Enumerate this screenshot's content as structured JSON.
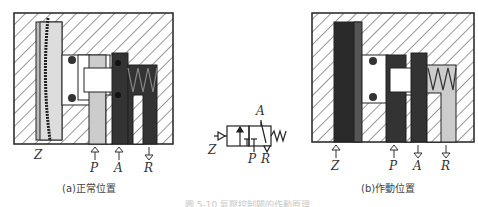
{
  "left_panel": {
    "caption": "(a)正常位置",
    "ports": [
      {
        "label": "Z",
        "arrow": "none"
      },
      {
        "label": "P",
        "arrow": "up"
      },
      {
        "label": "A",
        "arrow": "up"
      },
      {
        "label": "R",
        "arrow": "down"
      }
    ]
  },
  "symbol": {
    "ports": {
      "top": "A",
      "left": "Z",
      "bottom_left": "P",
      "bottom_right": "R"
    }
  },
  "right_panel": {
    "caption": "(b)作動位置",
    "ports": [
      {
        "label": "Z",
        "arrow": "up"
      },
      {
        "label": "P",
        "arrow": "up"
      },
      {
        "label": "A",
        "arrow": "down"
      },
      {
        "label": "R",
        "arrow": "down"
      }
    ]
  },
  "figure_caption": "圖 5-10 氣壓控制閥的作動原理"
}
